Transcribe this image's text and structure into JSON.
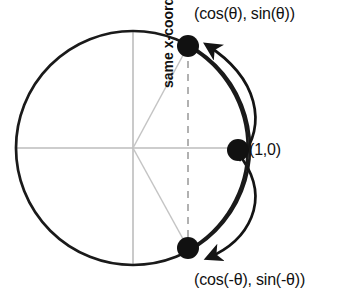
{
  "figure": {
    "colors": {
      "stroke_dark": "#1a1a1a",
      "axis_gray": "#b9b9b9",
      "radius_gray": "#c2c2c2",
      "dashed_gray": "#a8a8a8",
      "background": "#ffffff",
      "text": "#111111"
    },
    "circle": {
      "center_x": 133,
      "center_y": 148,
      "radius": 117,
      "stroke_width": 2.6
    },
    "axes": {
      "horizontal_y": 148,
      "vertical_x": 133,
      "show_grid": false
    },
    "points": [
      {
        "name": "point-upper",
        "label": "(cos(θ), sin(θ))",
        "x": 188,
        "y": 46,
        "dot_radius": 11
      },
      {
        "name": "point-right",
        "label": "(1,0)",
        "x": 238,
        "y": 150,
        "dot_radius": 11
      },
      {
        "name": "point-lower",
        "label": "(cos(-θ), sin(-θ))",
        "x": 188,
        "y": 248,
        "dot_radius": 11
      }
    ],
    "annotations": {
      "vertical_dashed_label": "same x-coordinate",
      "dashed_line_x": 188
    },
    "arcs": [
      {
        "name": "arc-counterclockwise",
        "from": "point-right",
        "to": "point-upper",
        "direction": "counterclockwise",
        "arrowhead_at": "end"
      },
      {
        "name": "arc-clockwise",
        "from": "point-right",
        "to": "point-lower",
        "direction": "clockwise",
        "arrowhead_at": "end"
      }
    ]
  },
  "labels": {
    "top_point": "(cos(θ), sin(θ))",
    "bottom_point": "(cos(-θ), sin(-θ))",
    "right_point": "(1,0)",
    "same_x": "same x-coordinate"
  }
}
